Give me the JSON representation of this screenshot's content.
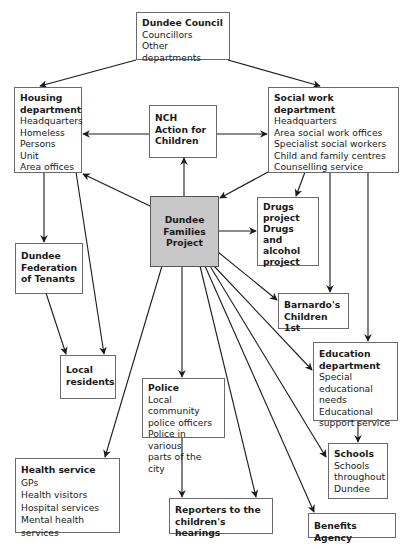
{
  "nodes": {
    "council": {
      "title": "Dundee Council",
      "items": [
        "Councillors",
        "Other departments"
      ]
    },
    "housing": {
      "title_lines": [
        "Housing",
        "department"
      ],
      "items": [
        "Headquarters",
        "Homeless",
        "Persons Unit",
        "Area offices"
      ]
    },
    "nch": {
      "title_lines": [
        "NCH",
        "Action for",
        "Children"
      ]
    },
    "social": {
      "title": "Social work department",
      "items": [
        "Headquarters",
        "Area social work offices",
        "Specialist social workers",
        "Child and family centres",
        "Counselling service"
      ]
    },
    "dfp": {
      "title_lines": [
        "Dundee",
        "Families",
        "Project"
      ]
    },
    "drugs": {
      "title_lines": [
        "Drugs",
        "project",
        "Drugs and",
        "alcohol",
        "project"
      ]
    },
    "tenants": {
      "title_lines": [
        "Dundee",
        "Federation",
        "of Tenants"
      ]
    },
    "barnardos": {
      "title_lines": [
        "Barnardo's",
        "Children 1st"
      ]
    },
    "residents": {
      "title_lines": [
        "Local",
        "residents"
      ]
    },
    "police": {
      "title": "Police",
      "items": [
        "Local community",
        "police officers",
        "Police in various",
        "parts of the city"
      ]
    },
    "education": {
      "title_lines": [
        "Education",
        "department"
      ],
      "items": [
        "Special",
        "educational needs",
        "Educational",
        "support service"
      ]
    },
    "health": {
      "title": "Health service",
      "items": [
        "GPs",
        "Health visitors",
        "Hospital services",
        "Mental health services"
      ]
    },
    "schools": {
      "title": "Schools",
      "items": [
        "Schools",
        "throughout",
        "Dundee"
      ]
    },
    "reporters": {
      "title_lines": [
        "Reporters to the",
        "children's hearings"
      ]
    },
    "benefits": {
      "title": "Benefits Agency"
    }
  },
  "colors": {
    "focal_fill": "#c8c8c8",
    "border": "#6a6a6a",
    "arrow": "#1a1a1a"
  }
}
